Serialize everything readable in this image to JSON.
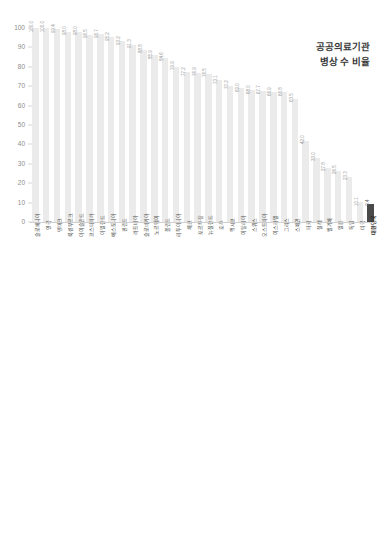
{
  "page": {
    "background": "#ffffff",
    "bar_color": "#ebebeb",
    "highlight_color": "#4a4a4a",
    "grid_color": "#f0f0f0"
  },
  "charts": [
    {
      "id": "chart-top",
      "title": "공공의료기관\n병상 수 비율",
      "highlight_label": "대한민국",
      "chart_data": {
        "type": "bar",
        "title": "공공의료기관 병상 수 비율",
        "xlabel": "",
        "ylabel": "",
        "ylim": [
          0,
          100
        ],
        "yticks": [
          0,
          10,
          20,
          30,
          40,
          50,
          60,
          70,
          80,
          90,
          100
        ],
        "grid": true,
        "legend": "none",
        "categories": [
          "슬로베니아",
          "영국",
          "덴마크",
          "룩셈부르크",
          "아이슬란드",
          "코스타리카",
          "아일랜드",
          "에스토니아",
          "핀란드",
          "라트비아",
          "슬로바키아",
          "노르웨이",
          "폴란드",
          "리투아니아",
          "체코",
          "포르투갈",
          "뉴질랜드",
          "호주",
          "멕시코",
          "이탈리아",
          "스위스",
          "오스트리아",
          "이스라엘",
          "그리스",
          "스페인",
          "터키",
          "칠레",
          "벨기에",
          "일본",
          "독일",
          "미국",
          "대한민국"
        ],
        "values": [
          100.0,
          100.0,
          99.4,
          98.0,
          98.0,
          96.5,
          96.7,
          95.2,
          93.2,
          91.3,
          88.8,
          85.9,
          84.6,
          79.9,
          77.2,
          76.9,
          76.5,
          73.1,
          70.2,
          69.0,
          68.0,
          67.7,
          66.9,
          66.8,
          63.5,
          42.0,
          33.0,
          27.8,
          26.5,
          23.3,
          10.1,
          9.4
        ],
        "value_labels": [
          "100.0",
          "100.0",
          "99.4",
          "98.0",
          "98.0",
          "96.5",
          "96.7",
          "95.2",
          "93.2",
          "91.3",
          "88.8",
          "85.9",
          "84.6",
          "79.9",
          "77.2",
          "76.9",
          "76.5",
          "73.1",
          "70.2",
          "69.0",
          "68.0",
          "67.7",
          "66.9",
          "66.8",
          "63.5",
          "42.0",
          "33.0",
          "27.8",
          "26.5",
          "23.3",
          "10.1",
          "9.4"
        ]
      }
    },
    {
      "id": "chart-bottom",
      "title": "인구 1000명당\n공공의료기관 병상 수",
      "highlight_label": "대한민국",
      "chart_data": {
        "type": "bar",
        "title": "인구 1000명당 공공의료기관 병상 수",
        "xlabel": "",
        "ylabel": "",
        "ylim": [
          0,
          7
        ],
        "yticks": [
          0,
          1,
          2,
          3,
          4,
          5,
          6,
          7
        ],
        "grid": true,
        "legend": "none",
        "categories": [
          "리투아니아",
          "폴란드",
          "헝가리",
          "슬로바키아",
          "라트비아",
          "룩셈부르크",
          "에스토니아",
          "프랑스",
          "체코",
          "벨기에",
          "그리스",
          "슬로베니아",
          "덴마크",
          "노르웨이",
          "코스타리카",
          "뉴질랜드",
          "영국",
          "포르투갈",
          "이스라엘",
          "터키",
          "이탈리아",
          "아일랜드",
          "호주",
          "스페인",
          "스위스",
          "멕시코",
          "일본",
          "칠레",
          "대한민국",
          "오스트리아",
          "독일",
          "미국",
          "네덜란드"
        ],
        "values": [
          5.8,
          5.5,
          4.8,
          4.7,
          4.7,
          4.2,
          4.2,
          3.6,
          3.4,
          3.1,
          2.9,
          2.8,
          2.7,
          2.7,
          2.6,
          2.5,
          2.4,
          2.4,
          2.3,
          2.3,
          2.2,
          2.1,
          2.0,
          2.0,
          1.6,
          1.6,
          1.3,
          1.0,
          1.3,
          0.7,
          0.5,
          0.4,
          0.4
        ],
        "value_labels": [
          "5.8",
          "5.5",
          "4.8",
          "4.7",
          "4.7",
          "4.2",
          "4.2",
          "3.6",
          "3.4",
          "3.1",
          "2.9",
          "2.8",
          "2.7",
          "2.7",
          "2.6",
          "2.5",
          "2.4",
          "2.4",
          "2.3",
          "2.3",
          "2.2",
          "2.1",
          "2.0",
          "2.0",
          "1.6",
          "1.6",
          "1.3",
          "1.0",
          "1.3",
          "0.7",
          "0.5",
          "0.4",
          "0.4"
        ]
      }
    }
  ]
}
